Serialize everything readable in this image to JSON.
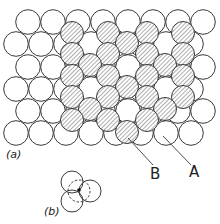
{
  "figure": {
    "colors": {
      "stroke": "#3a3a3a",
      "fill_open": "#ffffff",
      "hatch": "#6a6a6a",
      "background": "#ffffff"
    },
    "layer_a": {
      "radius": 12.3,
      "rows": [
        {
          "y": 22,
          "x": [
            28,
            53,
            78,
            103,
            128,
            153,
            178,
            203
          ]
        },
        {
          "y": 44,
          "x": [
            16,
            41,
            66,
            91,
            116,
            141,
            166,
            191
          ]
        },
        {
          "y": 67,
          "x": [
            28,
            53,
            78,
            103,
            128,
            153,
            178,
            203
          ]
        },
        {
          "y": 89,
          "x": [
            16,
            41,
            66,
            91,
            116,
            141,
            166,
            191
          ]
        },
        {
          "y": 111,
          "x": [
            28,
            53,
            78,
            103,
            128,
            153,
            178,
            203
          ]
        },
        {
          "y": 133,
          "x": [
            16,
            41,
            66,
            91,
            116,
            141,
            166,
            191
          ]
        }
      ]
    },
    "layer_b": {
      "radius": 11.5,
      "circles": [
        [
          72,
          33
        ],
        [
          108,
          33
        ],
        [
          147,
          33
        ],
        [
          183,
          33
        ],
        [
          127,
          43
        ],
        [
          72,
          54
        ],
        [
          108,
          54
        ],
        [
          147,
          54
        ],
        [
          183,
          54
        ],
        [
          90,
          65
        ],
        [
          165,
          65
        ],
        [
          72,
          76
        ],
        [
          108,
          76
        ],
        [
          147,
          76
        ],
        [
          183,
          76
        ],
        [
          127,
          87
        ],
        [
          72,
          97
        ],
        [
          108,
          97
        ],
        [
          147,
          97
        ],
        [
          183,
          97
        ],
        [
          90,
          109
        ],
        [
          165,
          109
        ],
        [
          72,
          120
        ],
        [
          108,
          120
        ],
        [
          147,
          120
        ],
        [
          127,
          132
        ]
      ]
    },
    "leaders": [
      {
        "name": "leader-b",
        "from": [
          128,
          138
        ],
        "to": [
          153,
          165
        ]
      },
      {
        "name": "leader-a",
        "from": [
          163,
          136
        ],
        "to": [
          191,
          165
        ]
      }
    ],
    "labels": {
      "part_a": "(a)",
      "part_b": "(b)",
      "label_a": "A",
      "label_b": "B"
    },
    "inset_b": {
      "radius": 11,
      "solid": [
        [
          72,
          182
        ],
        [
          90,
          191
        ],
        [
          72,
          201
        ]
      ],
      "dashed": {
        "cx": 79,
        "cy": 191
      },
      "dot": [
        79,
        190
      ]
    }
  }
}
